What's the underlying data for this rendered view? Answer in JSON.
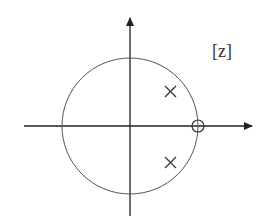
{
  "diagram": {
    "type": "pole-zero-plot",
    "plane_label": "[z]",
    "unit_circle": {
      "center": [
        0,
        0
      ],
      "radius": 1
    },
    "poles": [
      {
        "re": 0.6,
        "im": 0.5,
        "marker": "x"
      },
      {
        "re": 0.6,
        "im": -0.5,
        "marker": "x"
      }
    ],
    "zeros": [
      {
        "re": 1.0,
        "im": 0.0,
        "marker": "o"
      }
    ],
    "colors": {
      "axis": "#222222",
      "circle": "#555555",
      "marker": "#333333"
    }
  }
}
